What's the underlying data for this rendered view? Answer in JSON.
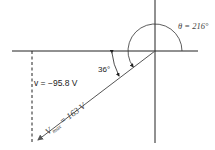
{
  "diagram": {
    "type": "phasor-diagram",
    "theta_label": "θ = 216°",
    "angle_label": "36°",
    "instantaneous_label": "v = −95.8 V",
    "vector_label_main": "V",
    "vector_label_sub": "max",
    "vector_label_value": " = 163 V",
    "colors": {
      "axis": "#222222",
      "vector": "#555555",
      "text": "#222222"
    }
  }
}
